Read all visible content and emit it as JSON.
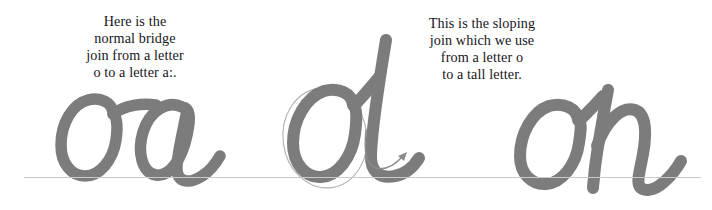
{
  "page": {
    "background_color": "#ffffff",
    "width": 712,
    "height": 210
  },
  "captions": {
    "bridge": {
      "text": "Here is the\nnormal bridge\njoin from a letter\no to a letter a:.",
      "lines": [
        "Here is the",
        "normal bridge",
        "join from a letter",
        "o to a letter a:."
      ],
      "color": "#17161a"
    },
    "sloping": {
      "text": "This is the sloping\njoin which we use\nfrom a letter o\nto a tall letter.",
      "lines": [
        "This is the sloping",
        "join which we use",
        "from a letter o",
        "to a tall letter."
      ],
      "color": "#17161a"
    }
  },
  "samples": {
    "oa": {
      "letters": "oa",
      "label": "handwriting-sample-oa",
      "join_type": "bridge join",
      "stroke_color": "#7c7c7c"
    },
    "ol": {
      "letters": "ol",
      "label": "handwriting-sample-ol",
      "join_type": "sloping join",
      "stroke_color": "#7c7c7c",
      "guide_color": "#b4b0ad",
      "start_dot": "stroke-start-dot",
      "end_arrow": "stroke-direction-arrow"
    },
    "oh": {
      "letters": "oh",
      "label": "handwriting-sample-oh",
      "join_type": "sloping join",
      "stroke_color": "#7c7c7c"
    }
  },
  "baseline": {
    "label": "writing-baseline",
    "color": "#c9c9c9"
  }
}
